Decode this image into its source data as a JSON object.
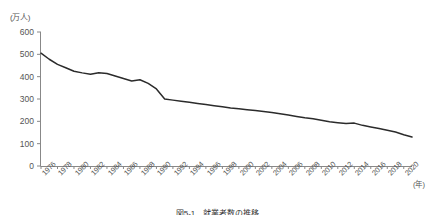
{
  "chart_data": {
    "type": "line",
    "title": "",
    "xlabel": "(年)",
    "ylabel": "(万人)",
    "ylim": [
      0,
      600
    ],
    "ytick_values": [
      0,
      100,
      200,
      300,
      400,
      500,
      600
    ],
    "ytick_labels": [
      "0",
      "100",
      "200",
      "300",
      "400",
      "500",
      "600"
    ],
    "xlim": [
      1976,
      2021
    ],
    "xtick_labels": [
      "1976",
      "1978",
      "1980",
      "1982",
      "1984",
      "1986",
      "1988",
      "1990",
      "1992",
      "1994",
      "1996",
      "1998",
      "2000",
      "2002",
      "2004",
      "2006",
      "2008",
      "2010",
      "2012",
      "2014",
      "2016",
      "2018",
      "2020"
    ],
    "xtick_values": [
      1976,
      1978,
      1980,
      1982,
      1984,
      1986,
      1988,
      1990,
      1992,
      1994,
      1996,
      1998,
      2000,
      2002,
      2004,
      2006,
      2008,
      2010,
      2012,
      2014,
      2016,
      2018,
      2020
    ],
    "grid": false,
    "legend": "none",
    "line_color": "#2b2b2b",
    "series": [
      {
        "name": "人数",
        "x": [
          1976,
          1977,
          1978,
          1979,
          1980,
          1981,
          1982,
          1983,
          1984,
          1985,
          1986,
          1987,
          1988,
          1989,
          1990,
          1991,
          1992,
          1993,
          1994,
          1995,
          1996,
          1997,
          1998,
          1999,
          2000,
          2001,
          2002,
          2003,
          2004,
          2005,
          2006,
          2007,
          2008,
          2009,
          2010,
          2011,
          2012,
          2013,
          2014,
          2015,
          2016,
          2017,
          2018,
          2019,
          2020,
          2021
        ],
        "values": [
          505,
          478,
          455,
          440,
          424,
          417,
          411,
          418,
          414,
          403,
          392,
          381,
          386,
          370,
          345,
          300,
          295,
          290,
          285,
          280,
          275,
          270,
          265,
          260,
          256,
          252,
          248,
          244,
          240,
          234,
          228,
          222,
          216,
          212,
          205,
          198,
          194,
          190,
          192,
          182,
          175,
          168,
          160,
          152,
          140,
          130
        ]
      }
    ]
  },
  "axis": {
    "y_unit": "(万人)",
    "x_unit": "(年)"
  },
  "caption": {
    "text": "図5-1　就業者数の推移"
  }
}
